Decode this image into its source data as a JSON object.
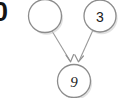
{
  "figure": {
    "type": "directed-graph",
    "background_color": "#ffffff",
    "width": 120,
    "height": 98
  },
  "clipped_text": {
    "value": "0",
    "note": "partially cropped bold glyph at left edge"
  },
  "style": {
    "node_fill": "#ffffff",
    "node_stroke": "#8c8c8c",
    "node_shadow": "#c9c9c9",
    "edge_color": "#9a9a9a",
    "label_color": "#1a1a1a"
  },
  "nodes": [
    {
      "id": "n1",
      "label": "",
      "cx": 45,
      "cy": 16,
      "r": 16.5,
      "label_style": "italic",
      "empty": true
    },
    {
      "id": "n2",
      "label": "3",
      "cx": 100,
      "cy": 16,
      "r": 16,
      "label_style": "upright",
      "empty": false
    },
    {
      "id": "n3",
      "label": "9",
      "cx": 74,
      "cy": 81,
      "r": 16.5,
      "label_style": "italic",
      "empty": false
    }
  ],
  "edges": [
    {
      "id": "e1",
      "from": "n1",
      "to": "n3",
      "x1": 52,
      "y1": 31,
      "x2": 68,
      "y2": 62,
      "directed": true
    },
    {
      "id": "e2",
      "from": "n2",
      "to": "n3",
      "x1": 93,
      "y1": 30,
      "x2": 80,
      "y2": 62,
      "directed": true
    }
  ]
}
